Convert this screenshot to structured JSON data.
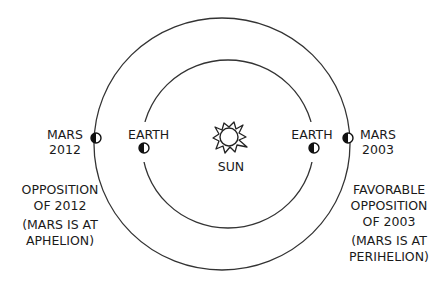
{
  "diagram": {
    "sun": {
      "label": "SUN"
    },
    "earth_left": {
      "label": "EARTH"
    },
    "earth_right": {
      "label": "EARTH"
    },
    "mars_left": {
      "label_line1": "MARS",
      "label_line2": "2012"
    },
    "mars_right": {
      "label_line1": "MARS",
      "label_line2": "2003"
    },
    "caption_left": {
      "line1": "OPPOSITION",
      "line2": "OF 2012",
      "line3": "(MARS IS AT",
      "line4": "APHELION)"
    },
    "caption_right": {
      "line1": "FAVORABLE",
      "line2": "OPPOSITION",
      "line3": "OF 2003",
      "line4": "(MARS IS AT",
      "line5": "PERIHELION)"
    },
    "colors": {
      "line": "#333333",
      "background": "#ffffff"
    }
  }
}
